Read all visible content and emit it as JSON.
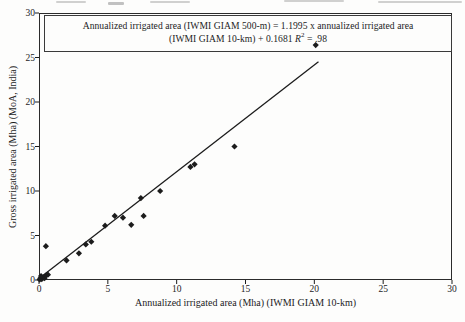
{
  "figure": {
    "background": "#fdfdfc",
    "ink_color": "#1c1c1c",
    "frame_color": "#2b2b2b"
  },
  "chart_data": {
    "type": "scatter",
    "title": "",
    "xlabel": "Annualized irrigated area (Mha) (IWMI GIAM 10-km)",
    "ylabel": "Gross irrigated area (Mha) (MoA, India)",
    "xlim": [
      0,
      30
    ],
    "ylim": [
      0,
      30
    ],
    "x_ticks": [
      0,
      5,
      10,
      15,
      20,
      25,
      30
    ],
    "y_ticks": [
      0,
      5,
      10,
      15,
      20,
      25,
      30
    ],
    "grid": false,
    "legend": "none",
    "marker": "diamond",
    "annotation": {
      "line1": "Annualized irrigated area (IWMI GIAM 500-m) = 1.1995 x annualized irrigated area",
      "line2_prefix": "(IWMI GIAM 10-km) + 0.1681 ",
      "r_symbol": "R",
      "r_exponent": "2",
      "r_suffix": " = .98"
    },
    "trendline": {
      "slope": 1.1995,
      "intercept": 0.1681,
      "x_start": 0,
      "x_end": 20.3
    },
    "points": [
      [
        0.05,
        0.05
      ],
      [
        0.1,
        0.2
      ],
      [
        0.2,
        0.1
      ],
      [
        0.3,
        0.3
      ],
      [
        0.15,
        0.45
      ],
      [
        0.4,
        0.2
      ],
      [
        0.5,
        0.5
      ],
      [
        0.65,
        0.6
      ],
      [
        0.5,
        3.8
      ],
      [
        2.0,
        2.2
      ],
      [
        2.9,
        3.0
      ],
      [
        3.4,
        4.0
      ],
      [
        3.8,
        4.3
      ],
      [
        4.8,
        6.1
      ],
      [
        5.5,
        7.2
      ],
      [
        6.1,
        7.0
      ],
      [
        6.7,
        6.2
      ],
      [
        7.4,
        9.2
      ],
      [
        7.6,
        7.2
      ],
      [
        8.8,
        10.0
      ],
      [
        11.0,
        12.7
      ],
      [
        11.3,
        13.0
      ],
      [
        14.2,
        15.0
      ],
      [
        20.1,
        26.4
      ]
    ]
  }
}
